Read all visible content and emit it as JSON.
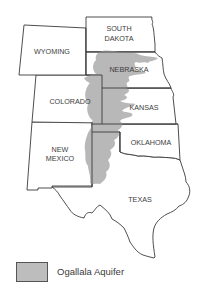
{
  "map": {
    "subject": "Ogallala Aquifer extent across the Great Plains states",
    "states": [
      {
        "id": "south-dakota",
        "lines": [
          "SOUTH",
          "DAKOTA"
        ]
      },
      {
        "id": "wyoming",
        "lines": [
          "WYOMING"
        ]
      },
      {
        "id": "nebraska",
        "lines": [
          "NEBRASKA"
        ]
      },
      {
        "id": "colorado",
        "lines": [
          "COLORADO"
        ]
      },
      {
        "id": "kansas",
        "lines": [
          "KANSAS"
        ]
      },
      {
        "id": "new-mexico",
        "lines": [
          "NEW",
          "MEXICO"
        ]
      },
      {
        "id": "oklahoma",
        "lines": [
          "OKLAHOMA"
        ]
      },
      {
        "id": "texas",
        "lines": [
          "TEXAS"
        ]
      }
    ],
    "colors": {
      "aquifer_fill": "#b8b8b8",
      "border": "#3a3a3a",
      "background": "#ffffff"
    }
  },
  "legend": {
    "items": [
      {
        "label": "Ogallala Aquifer",
        "color": "#bdbdbd"
      }
    ]
  }
}
